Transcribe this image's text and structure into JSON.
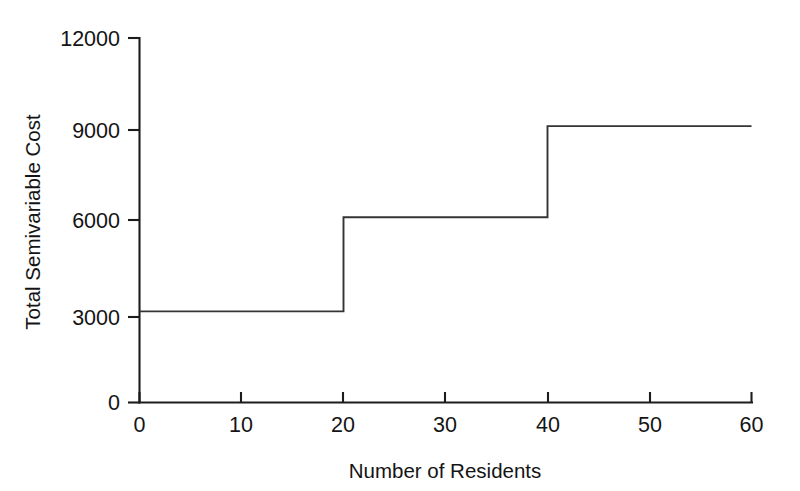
{
  "chart_data": {
    "type": "line",
    "title": "",
    "subtitle": "",
    "xlabel": "Number of Residents",
    "ylabel": "Total Semivariable Cost",
    "xlim": [
      0,
      60
    ],
    "ylim": [
      0,
      12000
    ],
    "xticks": [
      0,
      10,
      20,
      30,
      40,
      50,
      60
    ],
    "xtick_labels": [
      "0",
      "10",
      "20",
      "30",
      "40",
      "50",
      "60"
    ],
    "yticks": [
      0,
      3000,
      6000,
      9000,
      12000
    ],
    "ytick_labels": [
      "0",
      "3000",
      "6000",
      "9000",
      "12000"
    ],
    "grid": false,
    "legend": null,
    "legend_position": "none",
    "line_color": "#343434",
    "axis_color": "#1c1c1c",
    "background_color": "#ffffff",
    "series": [
      {
        "name": "Total Semivariable Cost",
        "style": "step-post",
        "points": [
          {
            "x": 0,
            "y": 3000
          },
          {
            "x": 20,
            "y": 3000
          },
          {
            "x": 20,
            "y": 6100
          },
          {
            "x": 40,
            "y": 6100
          },
          {
            "x": 40,
            "y": 9100
          },
          {
            "x": 60,
            "y": 9100
          }
        ]
      }
    ],
    "steps": [
      {
        "range": [
          0,
          20
        ],
        "value": 3000
      },
      {
        "range": [
          20,
          40
        ],
        "value": 6100
      },
      {
        "range": [
          40,
          60
        ],
        "value": 9100
      }
    ],
    "annotations": []
  }
}
